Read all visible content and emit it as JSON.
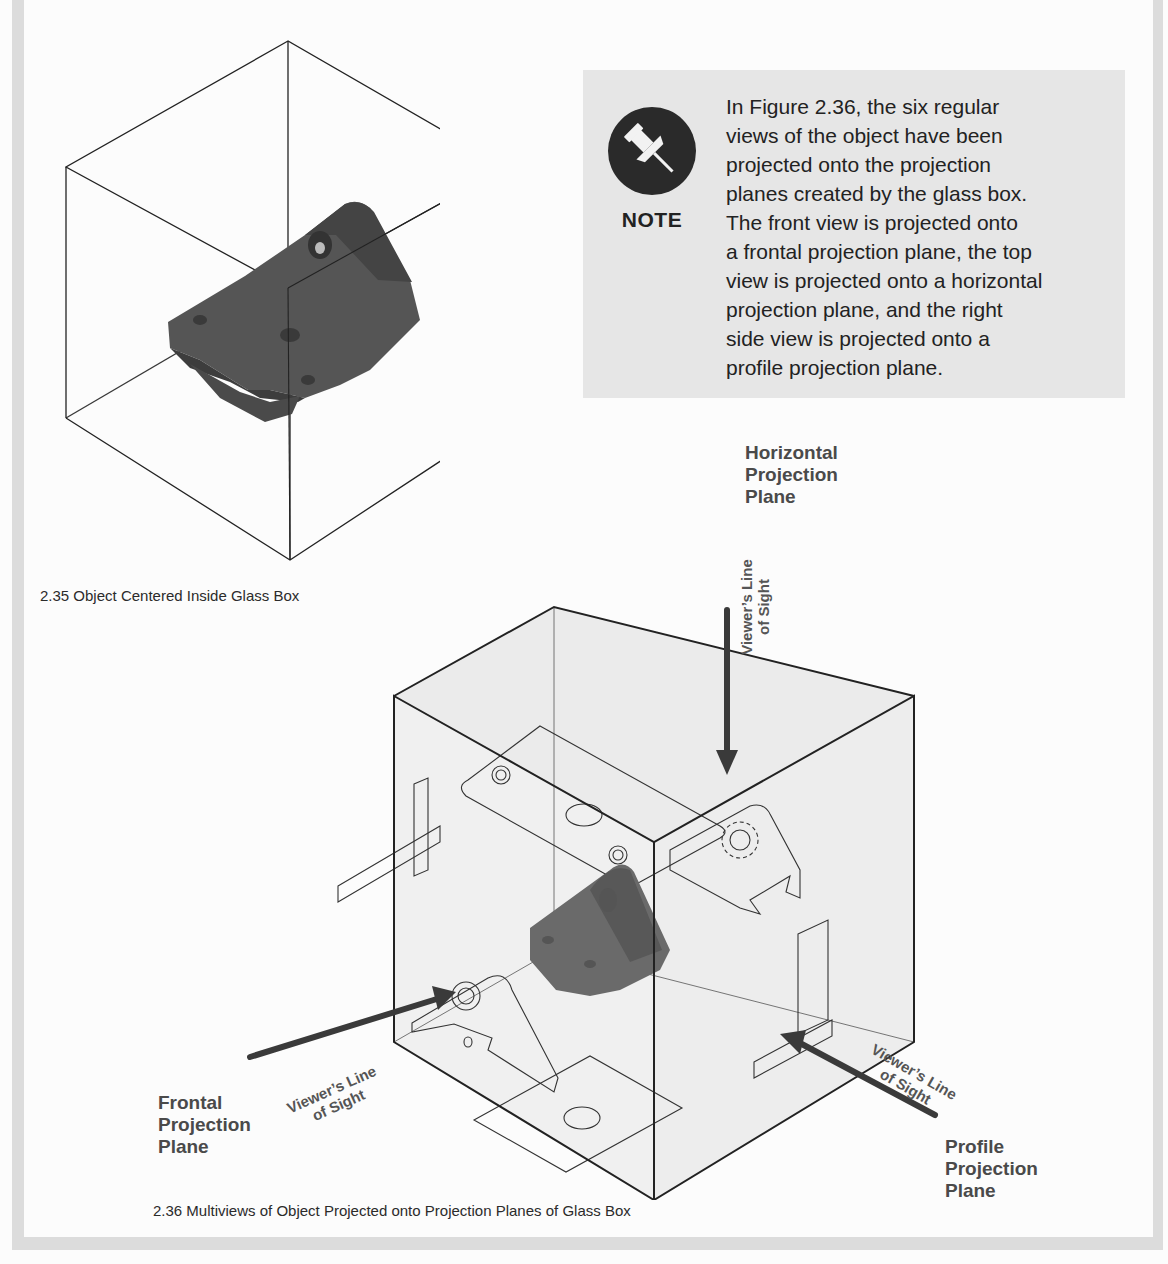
{
  "page": {
    "frame_color": "#dcdcdc",
    "background": "#fcfcfc"
  },
  "figure_2_35": {
    "caption": "2.35  Object Centered Inside Glass Box",
    "illustration": "object-in-glass-box"
  },
  "note": {
    "icon": "pushpin-icon",
    "label": "NOTE",
    "lines": [
      "In Figure 2.36, the six regular",
      "views of the object have been",
      "projected onto the projection",
      "planes created by the glass box.",
      "The front view is projected onto",
      "a frontal projection plane, the top",
      "view is projected onto a horizontal",
      "projection plane, and the right",
      "side view is projected onto a",
      "profile projection plane."
    ],
    "background": "#e6e6e6"
  },
  "figure_2_36": {
    "caption": "2.36  Multiviews of Object Projected onto Projection Planes of Glass Box",
    "labels": {
      "horizontal": [
        "Horizontal",
        "Projection",
        "Plane"
      ],
      "frontal": [
        "Frontal",
        "Projection",
        "Plane"
      ],
      "profile": [
        "Profile",
        "Projection",
        "Plane"
      ]
    },
    "line_of_sight": [
      "Viewer’s Line",
      "of Sight"
    ]
  }
}
